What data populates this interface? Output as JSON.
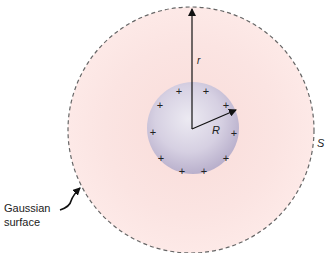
{
  "diagram": {
    "labels": {
      "r": "r",
      "R": "R",
      "S": "S",
      "gaussian_line1": "Gaussian",
      "gaussian_line2": "surface"
    },
    "charge_symbol": "+",
    "charge_count": 12,
    "colors": {
      "outer_fill": "#fbe3e1",
      "inner_fill": "#cfc8dc",
      "dashed_outline": "#666666",
      "arrow": "#111111"
    }
  }
}
